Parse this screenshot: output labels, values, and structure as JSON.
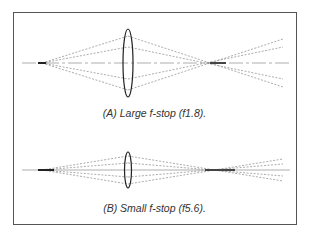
{
  "figure": {
    "panels": [
      {
        "id": "A",
        "caption": "(A)  Large f-stop (f1.8).",
        "aperture": "f1.8",
        "lens_height": "large"
      },
      {
        "id": "B",
        "caption": "(B)  Small f-stop (f5.6).",
        "aperture": "f5.6",
        "lens_height": "small"
      }
    ],
    "colors": {
      "frame": "#555555",
      "ray": "#888888",
      "lens": "#222222",
      "text": "#333333"
    }
  }
}
